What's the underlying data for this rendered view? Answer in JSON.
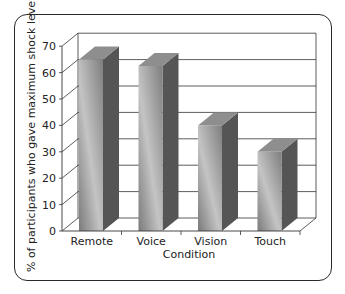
{
  "chart_data": {
    "type": "bar",
    "style": "3d-column",
    "title": "",
    "xlabel": "Condition",
    "ylabel": "% of participants who gave maximum shock level",
    "categories": [
      "Remote",
      "Voice",
      "Vision",
      "Touch"
    ],
    "values": [
      65,
      62.5,
      40,
      30
    ],
    "ylim": [
      0,
      70
    ],
    "yticks": [
      0,
      10,
      20,
      30,
      40,
      50,
      60,
      70
    ],
    "grid": true,
    "legend": null
  },
  "colors": {
    "bar_front_dark": "#7c7c7c",
    "bar_front_light": "#c2c2c2",
    "bar_side": "#555555",
    "bar_top": "#8e8e8e",
    "grid": "#333333",
    "frame": "#2a2a2a"
  }
}
